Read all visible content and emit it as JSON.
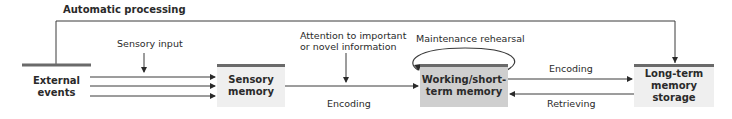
{
  "title": "Automatic processing",
  "nodes": {
    "external": {
      "line1": "External",
      "line2": "events"
    },
    "sensory": {
      "line1": "Sensory",
      "line2": "memory"
    },
    "working": {
      "line1": "Working/short-",
      "line2": "term memory"
    },
    "longterm": {
      "line1": "Long-term",
      "line2": "memory storage"
    }
  },
  "labels": {
    "sensory_input": "Sensory input",
    "attention_1": "Attention to important",
    "attention_2": "or novel information",
    "encoding_1": "Encoding",
    "maintenance": "Maintenance rehearsal",
    "encoding_2": "Encoding",
    "retrieving": "Retrieving"
  },
  "colors": {
    "box_light": "#efefef",
    "box_dark": "#cfcfcf",
    "line": "#3a3a3a",
    "bar": "#6a6a6a"
  }
}
